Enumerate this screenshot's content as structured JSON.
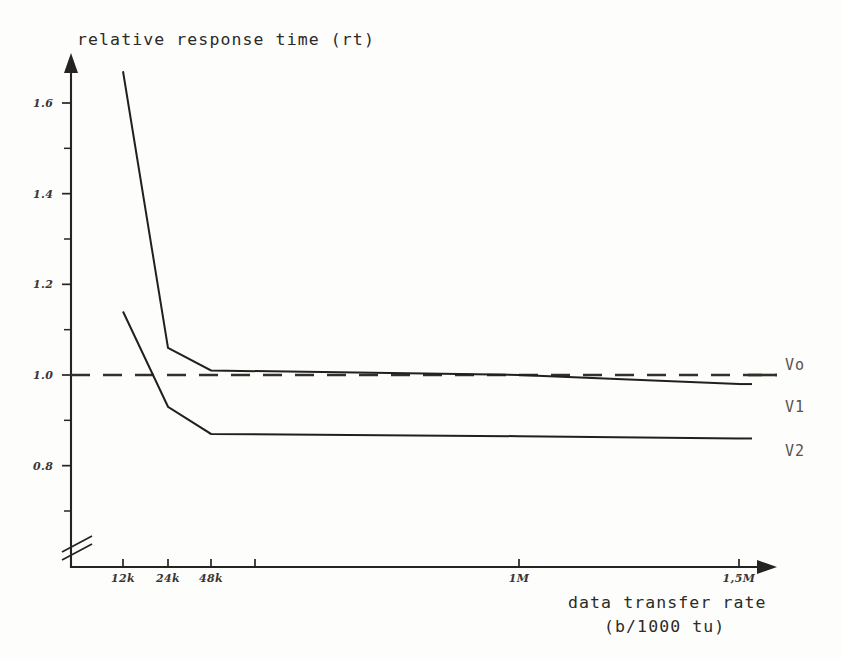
{
  "figure": {
    "ylabel": "relative response time (rt)",
    "xlabel_line1": "data transfer rate",
    "xlabel_line2": "(b/1000 tu)"
  },
  "yaxis": {
    "ticks": [
      {
        "label": "1.6",
        "value": 1.6
      },
      {
        "label": "1.4",
        "value": 1.4
      },
      {
        "label": "1.2",
        "value": 1.2
      },
      {
        "label": "1.0",
        "value": 1.0
      },
      {
        "label": "0.8",
        "value": 0.8
      }
    ],
    "minor_values": [
      1.5,
      1.3,
      1.1,
      0.9,
      0.7
    ]
  },
  "xaxis": {
    "ticks": [
      {
        "label": "12k",
        "px": 123
      },
      {
        "label": "24k",
        "px": 168
      },
      {
        "label": "48k",
        "px": 211
      },
      {
        "label": "",
        "px": 255
      },
      {
        "label": "1M",
        "px": 519
      },
      {
        "label": "1,5M",
        "px": 739
      }
    ],
    "break_marker": "axis-break"
  },
  "legend": {
    "items": [
      {
        "name": "Vo",
        "style": "dashed"
      },
      {
        "name": "V1",
        "style": "solid"
      },
      {
        "name": "V2",
        "style": "solid"
      }
    ]
  },
  "colors": {
    "ink": "#231f1d",
    "paper": "#fdfdfb",
    "label": "#55524e"
  },
  "chart_data": {
    "type": "line",
    "title": "",
    "xlabel": "data transfer rate (b/1000 tu)",
    "ylabel": "relative response time (rt)",
    "x": [
      "12k",
      "24k",
      "48k",
      "1M",
      "1,5M"
    ],
    "ylim": [
      0.7,
      1.7
    ],
    "grid": false,
    "legend_position": "right",
    "series": [
      {
        "name": "Vo",
        "style": "dashed",
        "values": [
          1.0,
          1.0,
          1.0,
          1.0,
          1.0
        ],
        "note": "reference baseline at rt = 1.0"
      },
      {
        "name": "V1",
        "style": "solid",
        "values": [
          1.67,
          1.06,
          1.01,
          1.0,
          0.98
        ]
      },
      {
        "name": "V2",
        "style": "solid",
        "values": [
          1.14,
          0.93,
          0.87,
          0.865,
          0.86
        ]
      }
    ]
  }
}
